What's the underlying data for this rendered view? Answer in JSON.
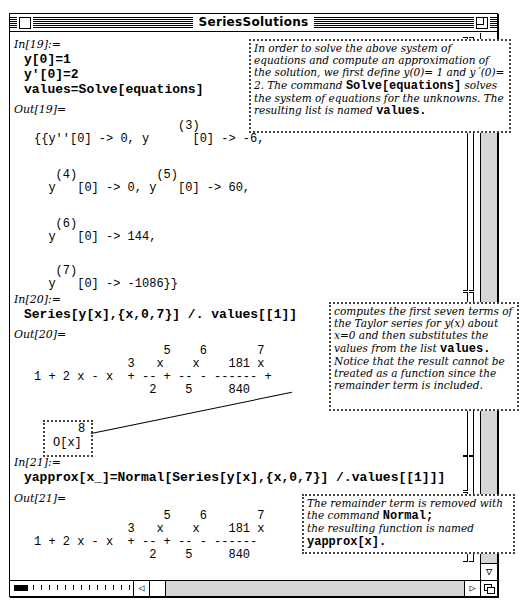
{
  "window": {
    "title": "SeriesSolutions"
  },
  "cells": {
    "in19": {
      "label": "In[19]:=",
      "lines": [
        "y[0]=1",
        "y'[0]=2",
        "values=Solve[equations]"
      ]
    },
    "out19": {
      "label": "Out[19]=",
      "lines": [
        "                    (3)",
        "{{y''[0] -> 0, y      [0] -> -6,",
        "",
        "   (4)           (5)",
        "  y   [0] -> 0, y   [0] -> 60,",
        "",
        "   (6)",
        "  y   [0] -> 144,",
        "",
        "   (7)",
        "  y   [0] -> -1086}}"
      ]
    },
    "in20": {
      "label": "In[20]:=",
      "text": "Series[y[x],{x,0,7}] /. values[[1]]"
    },
    "out20": {
      "label": "Out[20]=",
      "lines": [
        "                  5    6       7",
        "             3   x    x    181 x",
        "1 + 2 x - x  + -- + -- - ------ +",
        "                2    5     840"
      ],
      "remainder": {
        "exponent": "8",
        "term": "O[x]"
      }
    },
    "in21": {
      "label": "In[21]:=",
      "text": "yapprox[x_]=Normal[Series[y[x],{x,0,7}] /.values[[1]]]"
    },
    "out21": {
      "label": "Out[21]=",
      "lines": [
        "                  5    6       7",
        "             3   x    x    181 x",
        "1 + 2 x - x  + -- + -- - ------",
        "                2    5     840"
      ]
    }
  },
  "notes": {
    "note1": {
      "parts": [
        "In order to solve the above system of equations and compute an approximation of the solution, we first define y(0)= 1 and y´(0)= 2.  The command ",
        "Solve[equations]",
        " solves the  system of equations for the unknowns. The resulting list is named ",
        "values",
        "."
      ]
    },
    "note2": {
      "parts": [
        "computes the first seven terms of the Taylor series for y(x) about x=0 and then substitutes the values from the list ",
        "values",
        ".",
        "Notice that the result cannot be treated as a function since the remainder term is included."
      ]
    },
    "note3": {
      "parts": [
        "The remainder term is removed with the command ",
        "Normal",
        ";",
        "the resulting function is named",
        "yapprox[x]",
        "."
      ]
    }
  },
  "scrollbars": {
    "up_arrow": "△",
    "down_arrow": "▽",
    "left_arrow": "◁",
    "right_arrow": "▷"
  }
}
